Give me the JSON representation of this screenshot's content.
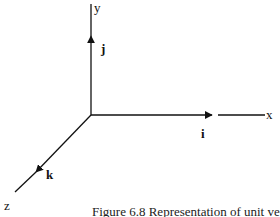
{
  "diagram": {
    "title": "Representation of unit vectors",
    "axes": {
      "x": {
        "label": "x",
        "unit_vector": "i"
      },
      "y": {
        "label": "y",
        "unit_vector": "j"
      },
      "z": {
        "label": "z",
        "unit_vector": "k"
      }
    },
    "caption": "Figure 6.8 Representation of unit vectors",
    "colors": {
      "line": "#111111",
      "background": "#ffffff"
    }
  }
}
